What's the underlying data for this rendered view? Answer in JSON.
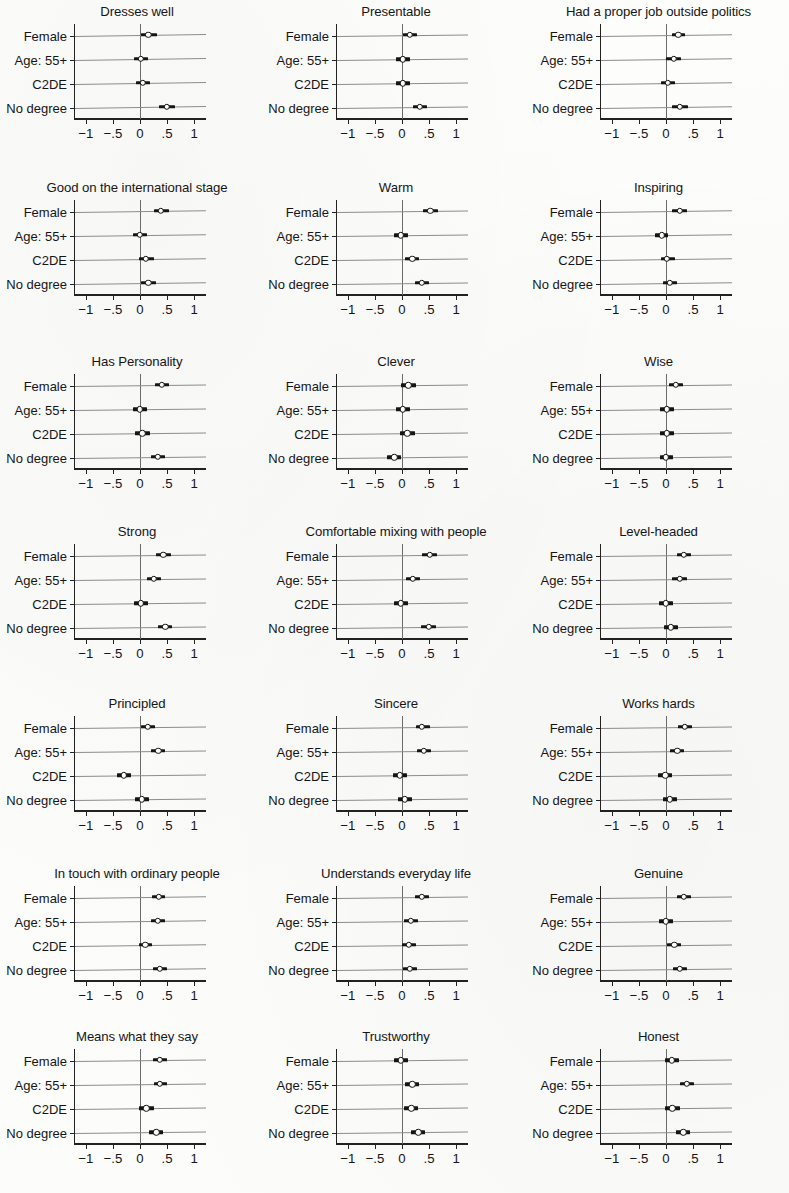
{
  "figure": {
    "row_labels": [
      "Female",
      "Age: 55+",
      "C2DE",
      "No degree"
    ],
    "x_ticks": [
      {
        "value": -1,
        "label": "−1"
      },
      {
        "value": -0.5,
        "label": "−.5"
      },
      {
        "value": 0,
        "label": "0"
      },
      {
        "value": 0.5,
        "label": ".5"
      },
      {
        "value": 1,
        "label": "1"
      }
    ],
    "xlim": [
      -1.22,
      1.22
    ],
    "reference_line": 0,
    "marker": "hollow-circle",
    "colors": {
      "line": "#151515",
      "axis": "#222222",
      "rowline": "#8c8c8c",
      "zeroline": "#6b6b6b"
    }
  },
  "chart_data": [
    {
      "type": "scatter",
      "title": "Dresses well",
      "xlabel": "",
      "ylabel": "",
      "xlim": [
        -1.22,
        1.22
      ],
      "categories": [
        "Female",
        "Age: 55+",
        "C2DE",
        "No degree"
      ],
      "values": [
        0.15,
        0.02,
        0.05,
        0.5
      ],
      "ci_low": [
        0.02,
        -0.11,
        -0.07,
        0.36
      ],
      "ci_high": [
        0.31,
        0.14,
        0.19,
        0.64
      ]
    },
    {
      "type": "scatter",
      "title": "Presentable",
      "xlabel": "",
      "ylabel": "",
      "xlim": [
        -1.22,
        1.22
      ],
      "categories": [
        "Female",
        "Age: 55+",
        "C2DE",
        "No degree"
      ],
      "values": [
        0.14,
        0.01,
        0.01,
        0.33
      ],
      "ci_low": [
        0.01,
        -0.12,
        -0.12,
        0.2
      ],
      "ci_high": [
        0.28,
        0.14,
        0.15,
        0.47
      ]
    },
    {
      "type": "scatter",
      "title": "Had a proper job outside politics",
      "xlabel": "",
      "ylabel": "",
      "xlim": [
        -1.22,
        1.22
      ],
      "categories": [
        "Female",
        "Age: 55+",
        "C2DE",
        "No degree"
      ],
      "values": [
        0.23,
        0.14,
        0.03,
        0.26
      ],
      "ci_low": [
        0.11,
        0.0,
        -0.1,
        0.12
      ],
      "ci_high": [
        0.36,
        0.27,
        0.16,
        0.4
      ]
    },
    {
      "type": "scatter",
      "title": "Good on the international stage",
      "xlabel": "",
      "ylabel": "",
      "xlim": [
        -1.22,
        1.22
      ],
      "categories": [
        "Female",
        "Age: 55+",
        "C2DE",
        "No degree"
      ],
      "values": [
        0.39,
        0.0,
        0.11,
        0.15
      ],
      "ci_low": [
        0.26,
        -0.13,
        -0.02,
        0.02
      ],
      "ci_high": [
        0.53,
        0.13,
        0.25,
        0.29
      ]
    },
    {
      "type": "scatter",
      "title": "Warm",
      "xlabel": "",
      "ylabel": "",
      "xlim": [
        -1.22,
        1.22
      ],
      "categories": [
        "Female",
        "Age: 55+",
        "C2DE",
        "No degree"
      ],
      "values": [
        0.52,
        -0.02,
        0.19,
        0.37
      ],
      "ci_low": [
        0.38,
        -0.15,
        0.06,
        0.24
      ],
      "ci_high": [
        0.66,
        0.11,
        0.32,
        0.5
      ]
    },
    {
      "type": "scatter",
      "title": "Inspiring",
      "xlabel": "",
      "ylabel": "",
      "xlim": [
        -1.22,
        1.22
      ],
      "categories": [
        "Female",
        "Age: 55+",
        "C2DE",
        "No degree"
      ],
      "values": [
        0.25,
        -0.08,
        0.02,
        0.07
      ],
      "ci_low": [
        0.12,
        -0.2,
        -0.1,
        -0.06
      ],
      "ci_high": [
        0.38,
        0.04,
        0.16,
        0.2
      ]
    },
    {
      "type": "scatter",
      "title": "Has Personality",
      "xlabel": "",
      "ylabel": "",
      "xlim": [
        -1.22,
        1.22
      ],
      "categories": [
        "Female",
        "Age: 55+",
        "C2DE",
        "No degree"
      ],
      "values": [
        0.4,
        0.0,
        0.04,
        0.33
      ],
      "ci_low": [
        0.27,
        -0.13,
        -0.09,
        0.2
      ],
      "ci_high": [
        0.54,
        0.13,
        0.18,
        0.46
      ]
    },
    {
      "type": "scatter",
      "title": "Clever",
      "xlabel": "",
      "ylabel": "",
      "xlim": [
        -1.22,
        1.22
      ],
      "categories": [
        "Female",
        "Age: 55+",
        "C2DE",
        "No degree"
      ],
      "values": [
        0.12,
        0.02,
        0.1,
        -0.14
      ],
      "ci_low": [
        -0.01,
        -0.11,
        -0.03,
        -0.27
      ],
      "ci_high": [
        0.26,
        0.15,
        0.24,
        -0.01
      ]
    },
    {
      "type": "scatter",
      "title": "Wise",
      "xlabel": "",
      "ylabel": "",
      "xlim": [
        -1.22,
        1.22
      ],
      "categories": [
        "Female",
        "Age: 55+",
        "C2DE",
        "No degree"
      ],
      "values": [
        0.18,
        0.01,
        0.01,
        0.0
      ],
      "ci_low": [
        0.05,
        -0.11,
        -0.11,
        -0.12
      ],
      "ci_high": [
        0.32,
        0.14,
        0.14,
        0.13
      ]
    },
    {
      "type": "scatter",
      "title": "Strong",
      "xlabel": "",
      "ylabel": "",
      "xlim": [
        -1.22,
        1.22
      ],
      "categories": [
        "Female",
        "Age: 55+",
        "C2DE",
        "No degree"
      ],
      "values": [
        0.43,
        0.26,
        0.01,
        0.47
      ],
      "ci_low": [
        0.3,
        0.13,
        -0.12,
        0.34
      ],
      "ci_high": [
        0.57,
        0.39,
        0.15,
        0.6
      ]
    },
    {
      "type": "scatter",
      "title": "Comfortable mixing with people",
      "xlabel": "",
      "ylabel": "",
      "xlim": [
        -1.22,
        1.22
      ],
      "categories": [
        "Female",
        "Age: 55+",
        "C2DE",
        "No degree"
      ],
      "values": [
        0.51,
        0.2,
        -0.02,
        0.5
      ],
      "ci_low": [
        0.37,
        0.07,
        -0.15,
        0.36
      ],
      "ci_high": [
        0.64,
        0.33,
        0.12,
        0.63
      ]
    },
    {
      "type": "scatter",
      "title": "Level-headed",
      "xlabel": "",
      "ylabel": "",
      "xlim": [
        -1.22,
        1.22
      ],
      "categories": [
        "Female",
        "Age: 55+",
        "C2DE",
        "No degree"
      ],
      "values": [
        0.33,
        0.25,
        0.0,
        0.09
      ],
      "ci_low": [
        0.2,
        0.12,
        -0.13,
        -0.04
      ],
      "ci_high": [
        0.46,
        0.38,
        0.13,
        0.22
      ]
    },
    {
      "type": "scatter",
      "title": "Principled",
      "xlabel": "",
      "ylabel": "",
      "xlim": [
        -1.22,
        1.22
      ],
      "categories": [
        "Female",
        "Age: 55+",
        "C2DE",
        "No degree"
      ],
      "values": [
        0.14,
        0.34,
        -0.3,
        0.03
      ],
      "ci_low": [
        0.01,
        0.21,
        -0.43,
        -0.1
      ],
      "ci_high": [
        0.28,
        0.47,
        -0.17,
        0.16
      ]
    },
    {
      "type": "scatter",
      "title": "Sincere",
      "xlabel": "",
      "ylabel": "",
      "xlim": [
        -1.22,
        1.22
      ],
      "categories": [
        "Female",
        "Age: 55+",
        "C2DE",
        "No degree"
      ],
      "values": [
        0.37,
        0.4,
        -0.04,
        0.05
      ],
      "ci_low": [
        0.25,
        0.27,
        -0.17,
        -0.08
      ],
      "ci_high": [
        0.51,
        0.53,
        0.09,
        0.19
      ]
    },
    {
      "type": "scatter",
      "title": "Works hards",
      "xlabel": "",
      "ylabel": "",
      "xlim": [
        -1.22,
        1.22
      ],
      "categories": [
        "Female",
        "Age: 55+",
        "C2DE",
        "No degree"
      ],
      "values": [
        0.35,
        0.21,
        -0.01,
        0.07
      ],
      "ci_low": [
        0.22,
        0.08,
        -0.14,
        -0.06
      ],
      "ci_high": [
        0.48,
        0.34,
        0.12,
        0.2
      ]
    },
    {
      "type": "scatter",
      "title": "In touch with ordinary people",
      "xlabel": "",
      "ylabel": "",
      "xlim": [
        -1.22,
        1.22
      ],
      "categories": [
        "Female",
        "Age: 55+",
        "C2DE",
        "No degree"
      ],
      "values": [
        0.35,
        0.33,
        0.1,
        0.37
      ],
      "ci_low": [
        0.23,
        0.21,
        -0.02,
        0.24
      ],
      "ci_high": [
        0.47,
        0.46,
        0.23,
        0.5
      ]
    },
    {
      "type": "scatter",
      "title": "Understands everyday life",
      "xlabel": "",
      "ylabel": "",
      "xlim": [
        -1.22,
        1.22
      ],
      "categories": [
        "Female",
        "Age: 55+",
        "C2DE",
        "No degree"
      ],
      "values": [
        0.37,
        0.16,
        0.13,
        0.14
      ],
      "ci_low": [
        0.24,
        0.03,
        0.0,
        0.01
      ],
      "ci_high": [
        0.5,
        0.29,
        0.26,
        0.27
      ]
    },
    {
      "type": "scatter",
      "title": "Genuine",
      "xlabel": "",
      "ylabel": "",
      "xlim": [
        -1.22,
        1.22
      ],
      "categories": [
        "Female",
        "Age: 55+",
        "C2DE",
        "No degree"
      ],
      "values": [
        0.33,
        0.0,
        0.15,
        0.26
      ],
      "ci_low": [
        0.21,
        -0.13,
        0.02,
        0.13
      ],
      "ci_high": [
        0.46,
        0.13,
        0.28,
        0.39
      ]
    },
    {
      "type": "scatter",
      "title": "Means what they say",
      "xlabel": "",
      "ylabel": "",
      "xlim": [
        -1.22,
        1.22
      ],
      "categories": [
        "Female",
        "Age: 55+",
        "C2DE",
        "No degree"
      ],
      "values": [
        0.37,
        0.37,
        0.12,
        0.3
      ],
      "ci_low": [
        0.24,
        0.25,
        -0.01,
        0.17
      ],
      "ci_high": [
        0.5,
        0.5,
        0.25,
        0.43
      ]
    },
    {
      "type": "scatter",
      "title": "Trustworthy",
      "xlabel": "",
      "ylabel": "",
      "xlim": [
        -1.22,
        1.22
      ],
      "categories": [
        "Female",
        "Age: 55+",
        "C2DE",
        "No degree"
      ],
      "values": [
        -0.02,
        0.19,
        0.17,
        0.3
      ],
      "ci_low": [
        -0.15,
        0.06,
        0.04,
        0.17
      ],
      "ci_high": [
        0.12,
        0.32,
        0.3,
        0.43
      ]
    },
    {
      "type": "scatter",
      "title": "Honest",
      "xlabel": "",
      "ylabel": "",
      "xlim": [
        -1.22,
        1.22
      ],
      "categories": [
        "Female",
        "Age: 55+",
        "C2DE",
        "No degree"
      ],
      "values": [
        0.11,
        0.38,
        0.12,
        0.32
      ],
      "ci_low": [
        -0.01,
        0.25,
        -0.01,
        0.19
      ],
      "ci_high": [
        0.24,
        0.51,
        0.25,
        0.45
      ]
    }
  ]
}
